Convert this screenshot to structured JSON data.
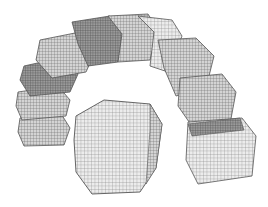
{
  "image": {
    "description": "3D wireframe mesh rendering of segmented blocks arranged in an arch, with one separate block in front",
    "background": "#ffffff",
    "mesh_color": "#555555",
    "mesh_shade_dark": "#6a6a6a",
    "mesh_shade_light": "#bdbdbd",
    "segments_in_arch": 9,
    "separate_blocks": 1
  }
}
